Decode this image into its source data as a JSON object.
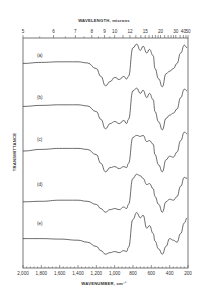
{
  "chart_data": {
    "type": "line",
    "title": "",
    "top_axis": {
      "label": "WAVELENGTH, microns",
      "ticks": [
        "5",
        "6",
        "7",
        "8",
        "9",
        "10",
        "12",
        "15",
        "20",
        "30",
        "40",
        "50"
      ]
    },
    "bottom_axis": {
      "label": "WAVENUMBER, cm⁻¹",
      "ticks": [
        "2,000",
        "1,800",
        "1,600",
        "1,400",
        "1,200",
        "1,000",
        "800",
        "600",
        "400",
        "200"
      ],
      "xlim": [
        2000,
        200
      ]
    },
    "ylabel": "TRANSMITTANCE",
    "grid": false,
    "legend": "inline labels",
    "series": [
      {
        "name": "(a)",
        "x": [
          2000,
          1800,
          1600,
          1400,
          1300,
          1200,
          1150,
          1100,
          1050,
          1000,
          950,
          900,
          870,
          850,
          800,
          760,
          720,
          690,
          650,
          620,
          580,
          560,
          520,
          480,
          440,
          400,
          360,
          320,
          280,
          240,
          210
        ],
        "values": [
          0.55,
          0.57,
          0.58,
          0.58,
          0.56,
          0.45,
          0.3,
          0.12,
          0.2,
          0.28,
          0.24,
          0.3,
          0.25,
          0.3,
          0.85,
          0.92,
          0.8,
          0.88,
          0.75,
          0.82,
          0.7,
          0.45,
          0.25,
          0.1,
          0.35,
          0.4,
          0.45,
          0.55,
          0.75,
          0.9,
          0.85
        ]
      },
      {
        "name": "(b)",
        "x": [
          2000,
          1800,
          1600,
          1400,
          1300,
          1200,
          1150,
          1100,
          1050,
          1000,
          950,
          900,
          870,
          850,
          800,
          760,
          720,
          690,
          650,
          620,
          580,
          560,
          520,
          480,
          440,
          400,
          360,
          320,
          280,
          240,
          210
        ],
        "values": [
          0.55,
          0.57,
          0.58,
          0.58,
          0.56,
          0.45,
          0.3,
          0.12,
          0.22,
          0.26,
          0.22,
          0.28,
          0.22,
          0.3,
          0.85,
          0.9,
          0.8,
          0.86,
          0.72,
          0.8,
          0.68,
          0.45,
          0.25,
          0.1,
          0.32,
          0.38,
          0.42,
          0.5,
          0.72,
          0.88,
          0.85
        ]
      },
      {
        "name": "(c)",
        "x": [
          2000,
          1800,
          1600,
          1400,
          1300,
          1200,
          1150,
          1100,
          1050,
          1000,
          950,
          900,
          870,
          850,
          800,
          760,
          720,
          690,
          650,
          620,
          580,
          560,
          520,
          480,
          440,
          400,
          360,
          320,
          280,
          240,
          210
        ],
        "values": [
          0.52,
          0.55,
          0.57,
          0.57,
          0.55,
          0.45,
          0.28,
          0.12,
          0.2,
          0.22,
          0.18,
          0.22,
          0.2,
          0.28,
          0.78,
          0.82,
          0.8,
          0.82,
          0.7,
          0.72,
          0.65,
          0.45,
          0.25,
          0.12,
          0.35,
          0.42,
          0.4,
          0.5,
          0.72,
          0.88,
          0.85
        ]
      },
      {
        "name": "(d)",
        "x": [
          2000,
          1800,
          1600,
          1400,
          1300,
          1200,
          1150,
          1100,
          1050,
          1000,
          950,
          900,
          870,
          850,
          800,
          760,
          720,
          690,
          650,
          620,
          580,
          560,
          520,
          480,
          440,
          400,
          360,
          320,
          280,
          240,
          210
        ],
        "values": [
          0.35,
          0.36,
          0.38,
          0.38,
          0.36,
          0.3,
          0.22,
          0.15,
          0.2,
          0.22,
          0.2,
          0.25,
          0.22,
          0.3,
          0.8,
          0.88,
          0.85,
          0.8,
          0.68,
          0.7,
          0.6,
          0.45,
          0.3,
          0.15,
          0.35,
          0.4,
          0.38,
          0.45,
          0.65,
          0.82,
          0.8
        ]
      },
      {
        "name": "(e)",
        "x": [
          2000,
          1800,
          1600,
          1400,
          1300,
          1200,
          1150,
          1100,
          1050,
          1000,
          950,
          900,
          870,
          850,
          800,
          760,
          720,
          690,
          650,
          620,
          580,
          560,
          520,
          480,
          440,
          400,
          360,
          320,
          280,
          240,
          210
        ],
        "values": [
          0.45,
          0.45,
          0.44,
          0.42,
          0.38,
          0.3,
          0.22,
          0.15,
          0.18,
          0.2,
          0.18,
          0.22,
          0.2,
          0.28,
          0.82,
          0.95,
          0.85,
          0.9,
          0.65,
          0.7,
          0.55,
          0.4,
          0.25,
          0.15,
          0.3,
          0.45,
          0.42,
          0.38,
          0.55,
          0.75,
          0.85
        ]
      }
    ]
  },
  "labels": {
    "top_axis_title": "WAVELENGTH, microns",
    "bottom_axis_title": "WAVENUMBER, cm⁻¹",
    "y_axis_title": "TRANSMITTANCE",
    "series": [
      "(a)",
      "(b)",
      "(c)",
      "(d)",
      "(e)"
    ]
  }
}
